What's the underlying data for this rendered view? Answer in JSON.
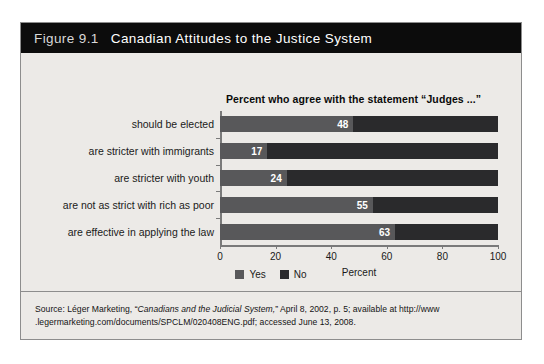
{
  "figure": {
    "number": "Figure 9.1",
    "title": "Canadian Attitudes to the Justice System"
  },
  "source": {
    "prefix": "Source: Léger Marketing, “",
    "work_title": "Canadians and the Judicial System,",
    "suffix": "” April 8, 2002, p. 5; available at http://www",
    "line2": ".legermarketing.com/documents/SPCLM/020408ENG.pdf; accessed June 13, 2008."
  },
  "colors": {
    "yes": "#58585a",
    "no": "#2a2a2c",
    "title_bar": "#0c0c0c",
    "panel": "#eceae7",
    "axis": "#7a7a7a"
  },
  "chart_data": {
    "type": "bar",
    "orientation": "horizontal",
    "stacked": true,
    "title": "Percent who agree with the statement “Judges ...”",
    "xlabel": "Percent",
    "ylabel": "",
    "xlim": [
      0,
      100
    ],
    "xticks": [
      0,
      20,
      40,
      60,
      80,
      100
    ],
    "xtick_labels": [
      "0",
      "20",
      "40",
      "60",
      "80",
      "100"
    ],
    "grid": false,
    "legend_position": "bottom",
    "categories": [
      "should be elected",
      "are stricter with immigrants",
      "are stricter with youth",
      "are not as strict with rich as poor",
      "are effective in applying the law"
    ],
    "series": [
      {
        "name": "Yes",
        "color": "#58585a",
        "values": [
          48,
          17,
          24,
          55,
          63
        ]
      },
      {
        "name": "No",
        "color": "#2a2a2c",
        "values": [
          52,
          83,
          76,
          45,
          37
        ]
      }
    ],
    "value_labels": [
      "48",
      "17",
      "24",
      "55",
      "63"
    ]
  }
}
